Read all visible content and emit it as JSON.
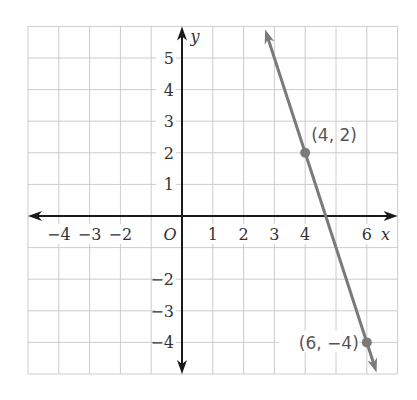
{
  "chart_data": {
    "type": "line",
    "title": "",
    "xlabel": "x",
    "ylabel": "y",
    "origin_label": "O",
    "xlim": [
      -5,
      7
    ],
    "ylim": [
      -5,
      6
    ],
    "grid": true,
    "x_ticks": [
      -4,
      -3,
      -2,
      1,
      2,
      3,
      4,
      6
    ],
    "x_tick_labels": [
      "−4",
      "−3",
      "−2",
      "1",
      "2",
      "3",
      "4",
      "6"
    ],
    "y_ticks": [
      5,
      4,
      3,
      2,
      1,
      -2,
      -3,
      -4
    ],
    "y_tick_labels": [
      "5",
      "4",
      "3",
      "2",
      "1",
      "−2",
      "−3",
      "−4"
    ],
    "series": [
      {
        "name": "line through (4, 2) and (6, -4)",
        "x": [
          4,
          6
        ],
        "y": [
          2,
          -4
        ],
        "slope": -3,
        "intercept": 14,
        "color": "#7a7a7a"
      }
    ],
    "points": [
      {
        "x": 4,
        "y": 2,
        "label": "(4, 2)"
      },
      {
        "x": 6,
        "y": -4,
        "label": "(6, −4)"
      }
    ]
  },
  "colors": {
    "grid": "#cccccc",
    "axis": "#1a1a1a",
    "line": "#7a7a7a",
    "label": "#555555"
  }
}
